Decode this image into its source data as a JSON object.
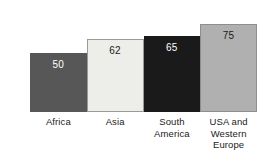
{
  "chart_data": {
    "type": "bar",
    "title": "",
    "subtitle": "",
    "xlabel": "",
    "ylabel": "",
    "ylim": [
      0,
      80
    ],
    "grid": false,
    "legend": "none",
    "orientation": "vertical",
    "bar_gap": "none",
    "categories": [
      "Africa",
      "Asia",
      "South America",
      "USA and Western Europe"
    ],
    "values": [
      50,
      62,
      65,
      75
    ],
    "value_labels": [
      "50",
      "62",
      "65",
      "75"
    ],
    "label_lines": [
      [
        "Africa"
      ],
      [
        "Asia"
      ],
      [
        "South",
        "America"
      ],
      [
        "USA and",
        "Western",
        "Europe"
      ]
    ],
    "bar_colors": [
      "#575757",
      "#ededea",
      "#1a1a1a",
      "#b0b0b0"
    ],
    "bar_border_colors": [
      "#575757",
      "#9a9a9a",
      "#1a1a1a",
      "#8e8e8e"
    ],
    "value_label_colors": [
      "#ffffff",
      "#1b1b1b",
      "#ffffff",
      "#1b1b1b"
    ],
    "label_text_color": "#1b1b1b",
    "background_color": "#ffffff"
  }
}
